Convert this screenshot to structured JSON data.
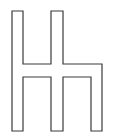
{
  "figure": {
    "stroke_color": "#3a3a3a",
    "fill_color": "#ffffff",
    "points": "12,11 23,11 23,64 51,64 51,11 63,11 63,64 102,64 102,131 91,131 91,77 63,77 63,131 51,131 51,77 23,77 23,131 12,131"
  }
}
